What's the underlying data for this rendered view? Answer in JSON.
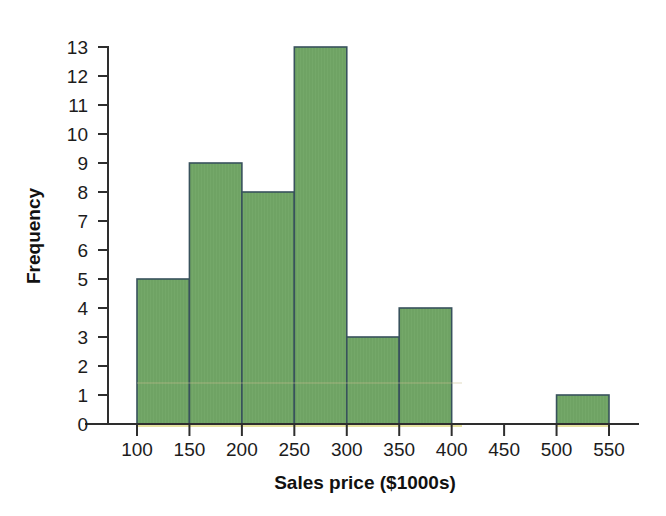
{
  "chart_data": {
    "type": "bar",
    "title": "",
    "subtitle": "",
    "xlabel": "Sales price ($1000s)",
    "ylabel": "Frequency",
    "grid": false,
    "legend": null,
    "legend_position": "none",
    "bin_width": 50,
    "xlim": [
      75,
      575
    ],
    "ylim": [
      0,
      13
    ],
    "xticks": [
      100,
      150,
      200,
      250,
      300,
      350,
      400,
      450,
      500,
      550
    ],
    "xtick_labels": [
      "100",
      "150",
      "200",
      "250",
      "300",
      "350",
      "400",
      "450",
      "500",
      "550"
    ],
    "yticks": [
      0,
      1,
      2,
      3,
      4,
      5,
      6,
      7,
      8,
      9,
      10,
      11,
      12,
      13
    ],
    "ytick_labels": [
      "0",
      "1",
      "2",
      "3",
      "4",
      "5",
      "6",
      "7",
      "8",
      "9",
      "10",
      "11",
      "12",
      "13"
    ],
    "categories": [
      "100-150",
      "150-200",
      "200-250",
      "250-300",
      "300-350",
      "350-400",
      "400-450",
      "450-500",
      "500-550"
    ],
    "bin_edges": [
      100,
      150,
      200,
      250,
      300,
      350,
      400,
      450,
      500,
      550
    ],
    "values": [
      5,
      9,
      8,
      13,
      3,
      4,
      0,
      0,
      1
    ],
    "bars": [
      {
        "label": "100-150",
        "x0": 100,
        "x1": 150,
        "value": 5
      },
      {
        "label": "150-200",
        "x0": 150,
        "x1": 200,
        "value": 9
      },
      {
        "label": "200-250",
        "x0": 200,
        "x1": 250,
        "value": 8
      },
      {
        "label": "250-300",
        "x0": 250,
        "x1": 300,
        "value": 13
      },
      {
        "label": "300-350",
        "x0": 300,
        "x1": 350,
        "value": 3
      },
      {
        "label": "350-400",
        "x0": 350,
        "x1": 400,
        "value": 4
      },
      {
        "label": "400-450",
        "x0": 400,
        "x1": 450,
        "value": 0
      },
      {
        "label": "450-500",
        "x0": 450,
        "x1": 500,
        "value": 0
      },
      {
        "label": "500-550",
        "x0": 500,
        "x1": 550,
        "value": 1
      }
    ],
    "colors": {
      "bar_fill": "#6fa364",
      "bar_edge": "#38525c",
      "axis": "#2e2e2e",
      "text": "#1c1c1c",
      "background": "#ffffff"
    }
  }
}
